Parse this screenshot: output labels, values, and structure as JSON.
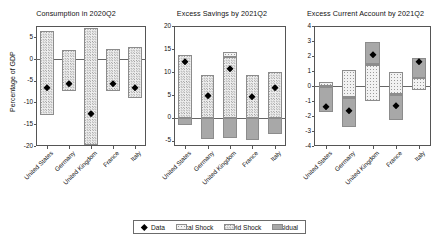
{
  "figure": {
    "ylabel": "Percentage of GDP",
    "countries": [
      "United States",
      "Germany",
      "United Kingdom",
      "France",
      "Italy"
    ]
  },
  "legend": {
    "items": [
      {
        "label": "Data",
        "kind": "marker"
      },
      {
        "label": "Fiscal Shock",
        "kind": "fiscal"
      },
      {
        "label": "Covid Shock",
        "kind": "covid"
      },
      {
        "label": "Residual",
        "kind": "residual"
      }
    ]
  },
  "chart_data": [
    {
      "type": "bar",
      "title": "Consumption in 2020Q2",
      "xlabel": "",
      "ylabel": "Percentage of GDP",
      "ylim": [
        -20,
        7.5
      ],
      "yticks": [
        5,
        0,
        -5,
        -10,
        -15,
        -20
      ],
      "ytick_labels": [
        "5",
        "0",
        "-5",
        "-10",
        "-15",
        "-20"
      ],
      "grid": false,
      "legend_position": "bottom-figure",
      "categories": [
        "United States",
        "Germany",
        "United Kingdom",
        "France",
        "Italy"
      ],
      "series": [
        {
          "name": "Fiscal Shock",
          "values": [
            0,
            0,
            0,
            0,
            0
          ]
        },
        {
          "name": "Covid Shock",
          "positive": [
            6.3,
            2.0,
            7.0,
            2.3,
            2.7
          ],
          "negative": [
            -12.8,
            -7.5,
            -19.8,
            -7.4,
            -9.0
          ]
        },
        {
          "name": "Residual",
          "values": [
            0,
            0,
            0,
            0,
            0
          ]
        }
      ],
      "data_points": [
        -6.8,
        -5.7,
        -12.6,
        -5.9,
        -6.7
      ]
    },
    {
      "type": "bar",
      "title": "Excess Savings by 2021Q2",
      "xlabel": "",
      "ylabel": "",
      "ylim": [
        -6.2,
        20
      ],
      "yticks": [
        20,
        15,
        10,
        5,
        0,
        -5
      ],
      "ytick_labels": [
        "20",
        "15",
        "10",
        "5",
        "0",
        "-5"
      ],
      "grid": false,
      "legend_position": "bottom-figure",
      "categories": [
        "United States",
        "Germany",
        "United Kingdom",
        "France",
        "Italy"
      ],
      "series": [
        {
          "name": "Fiscal Shock",
          "values": [
            0,
            0,
            1.1,
            0,
            0
          ]
        },
        {
          "name": "Covid Shock",
          "values": [
            13.7,
            9.4,
            13.2,
            9.2,
            10.0
          ]
        },
        {
          "name": "Residual",
          "values": [
            -1.7,
            -4.7,
            -4.5,
            -4.9,
            -3.5
          ]
        }
      ],
      "data_points": [
        12.1,
        4.7,
        10.6,
        4.5,
        6.5
      ]
    },
    {
      "type": "bar",
      "title": "Excess Current Account by 2021Q2",
      "xlabel": "",
      "ylabel": "",
      "ylim": [
        -4,
        4
      ],
      "yticks": [
        4,
        3,
        2,
        1,
        0,
        -1,
        -2,
        -3,
        -4
      ],
      "ytick_labels": [
        "4",
        "3",
        "2",
        "1",
        "0",
        "-1",
        "-2",
        "-3",
        "-4"
      ],
      "grid": false,
      "legend_position": "bottom-figure",
      "categories": [
        "United States",
        "Germany",
        "United Kingdom",
        "France",
        "Italy"
      ],
      "series": [
        {
          "name": "Fiscal Shock",
          "top": [
            0.25,
            1.1,
            1.45,
            0.95,
            0.6
          ],
          "bottom": [
            0.0,
            -0.75,
            -1.0,
            -0.55,
            -0.25
          ]
        },
        {
          "name": "Covid Shock",
          "top": [
            0.0,
            -0.75,
            1.45,
            -0.55,
            0.6
          ],
          "bottom": [
            -0.05,
            -0.8,
            1.4,
            -0.6,
            0.55
          ]
        },
        {
          "name": "Residual",
          "top": [
            -0.05,
            -0.8,
            2.95,
            -0.6,
            1.9
          ],
          "bottom": [
            -1.75,
            -2.75,
            1.45,
            -2.25,
            0.55
          ]
        }
      ],
      "data_points": [
        -1.4,
        -1.65,
        2.05,
        -1.3,
        1.6
      ]
    }
  ]
}
